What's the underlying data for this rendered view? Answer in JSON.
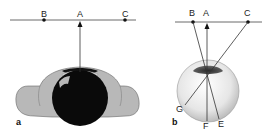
{
  "figure": {
    "panel_a": {
      "label": "a",
      "points": [
        {
          "name": "B",
          "x": 44
        },
        {
          "name": "A",
          "x": 80
        },
        {
          "name": "C",
          "x": 125
        }
      ],
      "description": "top view of head with eyeball, arrow from eye to point A"
    },
    "panel_b": {
      "label": "b",
      "points": [
        {
          "name": "B",
          "x": 193
        },
        {
          "name": "A",
          "x": 206
        },
        {
          "name": "C",
          "x": 248
        }
      ],
      "retina_points": [
        "G",
        "F",
        "E"
      ],
      "description": "eyeball with rays crossing at lens: B to E, C to G, A to F"
    },
    "colors": {
      "line": "#333333",
      "head_fill": "#b5b5b5",
      "eyeball_dark": "#0a0a0a",
      "eye_globe": "#e8e8e8",
      "iris": "#4a4a4a"
    }
  }
}
